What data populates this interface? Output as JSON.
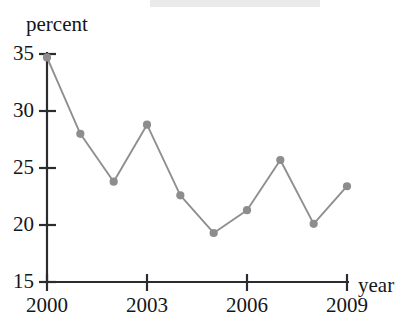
{
  "chart_data": {
    "type": "line",
    "title": "",
    "subtitle": "",
    "xlabel": "year",
    "ylabel": "percent",
    "x": [
      2000,
      2001,
      2002,
      2003,
      2004,
      2005,
      2006,
      2007,
      2008,
      2009
    ],
    "values": [
      34.7,
      28.0,
      23.8,
      28.8,
      22.6,
      19.3,
      21.3,
      25.7,
      20.1,
      23.4
    ],
    "series": [
      {
        "name": "percent",
        "values": [
          34.7,
          28.0,
          23.8,
          28.8,
          22.6,
          19.3,
          21.3,
          25.7,
          20.1,
          23.4
        ]
      }
    ],
    "xlim": [
      2000,
      2009
    ],
    "ylim": [
      15,
      35
    ],
    "xticks": [
      2000,
      2003,
      2006,
      2009
    ],
    "xtick_labels": [
      "2000",
      "2003",
      "2006",
      "2009"
    ],
    "yticks": [
      15,
      20,
      25,
      30,
      35
    ],
    "ytick_labels": [
      "15",
      "20",
      "25",
      "30",
      "35"
    ],
    "grid": false,
    "legend": false,
    "legend_position": "none",
    "marker": "circle",
    "annotations": []
  },
  "style": {
    "line_color": "#8f8f8f",
    "marker_color": "#8d8d8d",
    "axis_color": "#2b2c30",
    "text_color": "#15161a",
    "background": "#ffffff"
  },
  "labels": {
    "ylabel": "percent",
    "xlabel": "year",
    "ytick_35": "35",
    "ytick_30": "30",
    "ytick_25": "25",
    "ytick_20": "20",
    "ytick_15": "15",
    "xtick_2000": "2000",
    "xtick_2003": "2003",
    "xtick_2006": "2006",
    "xtick_2009": "2009"
  }
}
